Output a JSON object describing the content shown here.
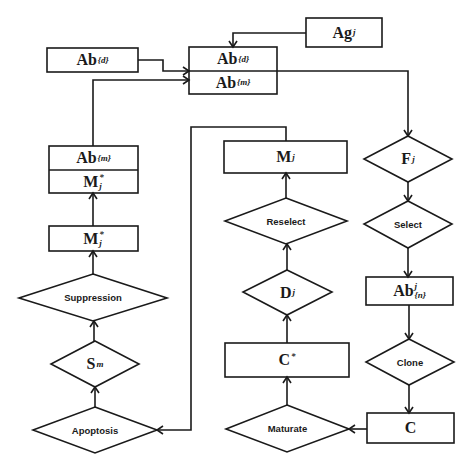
{
  "diagram": {
    "colors": {
      "stroke": "#1a1a1a",
      "background": "#ffffff",
      "text": "#1a1a1a"
    },
    "nodes": {
      "ag_j": {
        "shape": "rect",
        "base": "Ag",
        "sub": "j"
      },
      "ab_d_input": {
        "shape": "rect",
        "base": "Ab",
        "sub": "{d}"
      },
      "ab_pool": {
        "shape": "split-rect",
        "top": {
          "base": "Ab",
          "sub": "{d}"
        },
        "bottom": {
          "base": "Ab",
          "sub": "{m}"
        }
      },
      "ab_m_memory": {
        "shape": "split-rect",
        "top": {
          "base": "Ab",
          "sub": "{m}"
        },
        "bottom": {
          "base": "M",
          "sup": "*",
          "sub": "j"
        }
      },
      "m_star_j": {
        "shape": "rect",
        "base": "M",
        "sup": "*",
        "sub": "j"
      },
      "suppression": {
        "shape": "diamond",
        "label": "Suppression"
      },
      "s_m": {
        "shape": "diamond",
        "base": "S",
        "sub": "m"
      },
      "apoptosis": {
        "shape": "diamond",
        "label": "Apoptosis"
      },
      "m_j": {
        "shape": "rect",
        "base": "M",
        "sub": "j"
      },
      "reselect": {
        "shape": "diamond",
        "label": "Reselect"
      },
      "d_j": {
        "shape": "diamond",
        "base": "D",
        "sub": "j"
      },
      "c_star": {
        "shape": "rect",
        "base": "C",
        "sup": "*"
      },
      "maturate": {
        "shape": "diamond",
        "label": "Maturate"
      },
      "f_j": {
        "shape": "diamond",
        "base": "F",
        "sub": "j"
      },
      "select": {
        "shape": "diamond",
        "label": "Select"
      },
      "ab_n_j": {
        "shape": "rect",
        "base": "Ab",
        "sup": "j",
        "sub": "{n}"
      },
      "clone": {
        "shape": "diamond",
        "label": "Clone"
      },
      "c": {
        "shape": "rect",
        "base": "C"
      }
    },
    "edges": [
      {
        "from": "ag_j",
        "to": "ab_pool"
      },
      {
        "from": "ab_d_input",
        "to": "ab_pool"
      },
      {
        "from": "ab_m_memory",
        "to": "ab_pool"
      },
      {
        "from": "ab_pool",
        "to": "f_j"
      },
      {
        "from": "f_j",
        "to": "select"
      },
      {
        "from": "select",
        "to": "ab_n_j"
      },
      {
        "from": "ab_n_j",
        "to": "clone"
      },
      {
        "from": "clone",
        "to": "c"
      },
      {
        "from": "c",
        "to": "maturate"
      },
      {
        "from": "maturate",
        "to": "c_star"
      },
      {
        "from": "c_star",
        "to": "d_j"
      },
      {
        "from": "d_j",
        "to": "reselect"
      },
      {
        "from": "reselect",
        "to": "m_j"
      },
      {
        "from": "m_j",
        "to": "apoptosis"
      },
      {
        "from": "apoptosis",
        "to": "s_m"
      },
      {
        "from": "s_m",
        "to": "suppression"
      },
      {
        "from": "suppression",
        "to": "m_star_j"
      },
      {
        "from": "m_star_j",
        "to": "ab_m_memory"
      }
    ]
  }
}
